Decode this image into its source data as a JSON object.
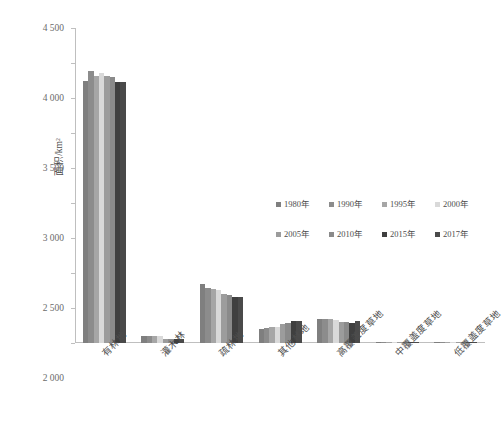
{
  "chart_data": {
    "type": "bar",
    "title": "",
    "xlabel": "",
    "ylabel": "面积/km²",
    "ylim": [
      0,
      4500
    ],
    "ytick_step": 500,
    "grid": false,
    "legend_position": "center-right",
    "categories": [
      "有林地",
      "灌木林",
      "疏林地",
      "其他林地",
      "高覆盖度草地",
      "中覆盖度草地",
      "低覆盖度草地"
    ],
    "yticks": [
      "0",
      "500",
      "1 000",
      "1 500",
      "2 000",
      "2 500",
      "3 000",
      "3 500",
      "4 000",
      "4 500"
    ],
    "series": [
      {
        "name": "1980年",
        "color": "#7f7f7f",
        "values": [
          3750,
          95,
          840,
          205,
          345,
          8,
          3
        ]
      },
      {
        "name": "1990年",
        "color": "#8c8c8c",
        "values": [
          3880,
          95,
          780,
          215,
          350,
          8,
          3
        ]
      },
      {
        "name": "1995年",
        "color": "#a6a6a6",
        "values": [
          3810,
          95,
          770,
          225,
          340,
          8,
          3
        ]
      },
      {
        "name": "2000年",
        "color": "#d9d9d9",
        "values": [
          3855,
          95,
          755,
          230,
          330,
          8,
          3
        ]
      },
      {
        "name": "2005年",
        "color": "#9c9c9c",
        "values": [
          3815,
          60,
          700,
          270,
          300,
          6,
          3
        ]
      },
      {
        "name": "2010年",
        "color": "#8a8a8a",
        "values": [
          3800,
          58,
          690,
          280,
          295,
          6,
          3
        ]
      },
      {
        "name": "2015年",
        "color": "#3f3f3f",
        "values": [
          3730,
          55,
          660,
          310,
          290,
          5,
          3
        ]
      },
      {
        "name": "2017年",
        "color": "#4a4a4a",
        "values": [
          3735,
          55,
          655,
          310,
          320,
          5,
          3
        ]
      }
    ]
  },
  "axis": {
    "y_title": "面积/km²"
  }
}
